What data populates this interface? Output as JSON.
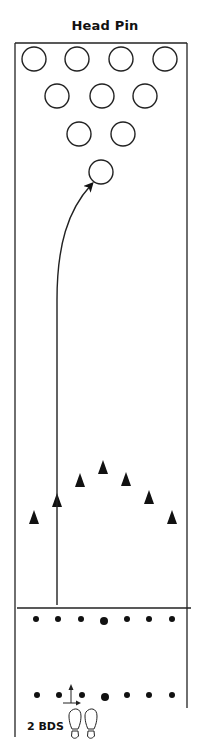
{
  "title": "Head Pin",
  "diagram": {
    "type": "bowling-lane",
    "lane": {
      "left": 15,
      "right": 187,
      "top": 43,
      "foul_line_y": 608,
      "approach_bottom": 737
    },
    "pins": [
      {
        "number": 7,
        "row": 4,
        "x": 34,
        "y": 59
      },
      {
        "number": 8,
        "row": 4,
        "x": 77,
        "y": 59
      },
      {
        "number": 9,
        "row": 4,
        "x": 121,
        "y": 59
      },
      {
        "number": 10,
        "row": 4,
        "x": 165,
        "y": 59
      },
      {
        "number": 4,
        "row": 3,
        "x": 57,
        "y": 96
      },
      {
        "number": 5,
        "row": 3,
        "x": 102,
        "y": 96
      },
      {
        "number": 6,
        "row": 3,
        "x": 145,
        "y": 96
      },
      {
        "number": 2,
        "row": 2,
        "x": 79,
        "y": 134
      },
      {
        "number": 3,
        "row": 2,
        "x": 123,
        "y": 134
      },
      {
        "number": 1,
        "row": 1,
        "x": 101,
        "y": 172,
        "label": "head-pin"
      }
    ],
    "pin_radius": 12,
    "target_arrows": [
      {
        "x": 34,
        "y": 517
      },
      {
        "x": 57,
        "y": 500
      },
      {
        "x": 80,
        "y": 480
      },
      {
        "x": 103,
        "y": 467
      },
      {
        "x": 126,
        "y": 479
      },
      {
        "x": 149,
        "y": 497
      },
      {
        "x": 172,
        "y": 517
      }
    ],
    "foul_line_dots": [
      {
        "x": 36,
        "y": 619,
        "size": "small"
      },
      {
        "x": 58,
        "y": 619,
        "size": "small"
      },
      {
        "x": 81,
        "y": 619,
        "size": "small"
      },
      {
        "x": 104,
        "y": 621,
        "size": "large"
      },
      {
        "x": 127,
        "y": 619,
        "size": "small"
      },
      {
        "x": 149,
        "y": 619,
        "size": "small"
      },
      {
        "x": 172,
        "y": 619,
        "size": "small"
      }
    ],
    "approach_dots": [
      {
        "x": 37,
        "y": 695,
        "size": "small"
      },
      {
        "x": 59,
        "y": 695,
        "size": "small"
      },
      {
        "x": 82,
        "y": 695,
        "size": "small"
      },
      {
        "x": 105,
        "y": 697,
        "size": "large"
      },
      {
        "x": 127,
        "y": 695,
        "size": "small"
      },
      {
        "x": 149,
        "y": 695,
        "size": "small"
      },
      {
        "x": 172,
        "y": 695,
        "size": "small"
      }
    ],
    "ball_path": {
      "start": {
        "x": 57,
        "y": 605
      },
      "straight_to": {
        "x": 57,
        "y": 300
      },
      "curve_to": {
        "x": 91,
        "y": 185
      },
      "description": "Ball rolls straight over second arrow, then hooks into the head pin"
    },
    "feet_position": {
      "shift_label": "2 BDS",
      "shift_direction": "right",
      "stance_x": 82,
      "stance_y": 718
    }
  },
  "colors": {
    "line": "#222222",
    "fill": "#111111",
    "background": "#ffffff"
  }
}
